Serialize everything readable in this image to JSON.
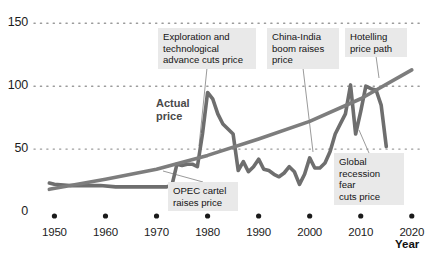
{
  "chart_data": {
    "type": "line",
    "title": "",
    "subtitle": "",
    "xlabel": "Year",
    "ylabel": "",
    "xlim": [
      1946,
      2022
    ],
    "ylim": [
      0,
      155
    ],
    "grid": "horizontal-dotted",
    "legend": "inline-labels",
    "x_ticks": [
      "1950",
      "1960",
      "1970",
      "1980",
      "1990",
      "2000",
      "2010",
      "2020"
    ],
    "x_tick_values": [
      1950,
      1960,
      1970,
      1980,
      1990,
      2000,
      2010,
      2020
    ],
    "y_ticks": [
      "0",
      "50",
      "100",
      "150"
    ],
    "y_tick_values": [
      0,
      50,
      100,
      150
    ],
    "series": [
      {
        "name": "Actual price",
        "color": "#6e6e6e",
        "x": [
          1949,
          1950,
          1953,
          1956,
          1959,
          1962,
          1965,
          1968,
          1970,
          1972,
          1973,
          1974,
          1975,
          1976,
          1977,
          1978,
          1979,
          1980,
          1981,
          1982,
          1983,
          1984,
          1985,
          1986,
          1987,
          1988,
          1989,
          1990,
          1991,
          1992,
          1993,
          1994,
          1995,
          1996,
          1997,
          1998,
          1999,
          2000,
          2001,
          2002,
          2003,
          2004,
          2005,
          2006,
          2007,
          2008,
          2009,
          2010,
          2011,
          2012,
          2013,
          2014,
          2015
        ],
        "values": [
          23,
          22,
          21,
          21,
          21,
          20,
          20,
          20,
          20,
          20,
          21,
          38,
          37,
          38,
          38,
          36,
          62,
          95,
          90,
          78,
          70,
          66,
          62,
          33,
          40,
          32,
          36,
          42,
          34,
          33,
          30,
          28,
          31,
          36,
          32,
          22,
          30,
          43,
          35,
          35,
          39,
          48,
          62,
          70,
          78,
          101,
          62,
          80,
          100,
          98,
          97,
          85,
          52
        ]
      },
      {
        "name": "Hotelling price path",
        "color": "#7d7d7d",
        "x": [
          1949,
          1960,
          1970,
          1980,
          1990,
          2000,
          2010,
          2020
        ],
        "values": [
          18,
          26,
          34,
          45,
          58,
          72,
          90,
          113
        ]
      }
    ],
    "annotations": [
      {
        "id": "exploration",
        "text": "Exploration and\ntechnological\nadvance cuts price",
        "box_x": 158,
        "box_y": 28,
        "box_w": 98,
        "box_h": 40,
        "target_x": 199,
        "target_y": 146
      },
      {
        "id": "china-india",
        "text": "China-India\nboom raises\nprice",
        "box_x": 267,
        "box_y": 28,
        "box_w": 72,
        "box_h": 40,
        "target_x": 313,
        "target_y": 152
      },
      {
        "id": "hotelling",
        "text": "Hotelling\nprice path",
        "box_x": 345,
        "box_y": 28,
        "box_w": 62,
        "box_h": 28,
        "target_x": 379,
        "target_y": 78
      },
      {
        "id": "opec",
        "text": "OPEC cartel\nraises price",
        "box_x": 168,
        "box_y": 182,
        "box_w": 70,
        "box_h": 28,
        "target_x": 163,
        "target_y": 171
      },
      {
        "id": "recession",
        "text": "Global\nrecession fear\ncuts price",
        "box_x": 334,
        "box_y": 153,
        "box_w": 70,
        "box_h": 40,
        "target_x": 359,
        "target_y": 130
      }
    ],
    "series_labels": [
      {
        "id": "actual-price",
        "text": "Actual\nprice",
        "x": 156,
        "y": 97
      }
    ]
  }
}
